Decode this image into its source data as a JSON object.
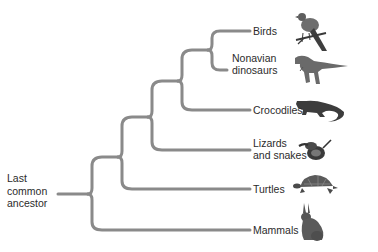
{
  "diagram": {
    "type": "phylogenetic-tree",
    "root_label": [
      "Last",
      "common",
      "ancestor"
    ],
    "colors": {
      "branch": "#8a8a8a",
      "text": "#2b2b2b",
      "background": "#ffffff"
    },
    "taxa": [
      {
        "id": "birds",
        "label_lines": [
          "Birds"
        ],
        "image": "bird-icon"
      },
      {
        "id": "nonavian-dinosaurs",
        "label_lines": [
          "Nonavian",
          "dinosaurs"
        ],
        "image": "dinosaur-icon"
      },
      {
        "id": "crocodiles",
        "label_lines": [
          "Crocodiles"
        ],
        "image": "crocodile-icon"
      },
      {
        "id": "lizards-and-snakes",
        "label_lines": [
          "Lizards",
          "and snakes"
        ],
        "image": "snake-icon"
      },
      {
        "id": "turtles",
        "label_lines": [
          "Turtles"
        ],
        "image": "turtle-icon"
      },
      {
        "id": "mammals",
        "label_lines": [
          "Mammals"
        ],
        "image": "rabbit-icon"
      }
    ],
    "topology": "(Mammals,(Turtles,(Lizards and snakes,(Crocodiles,(Birds,Nonavian dinosaurs)))))"
  }
}
